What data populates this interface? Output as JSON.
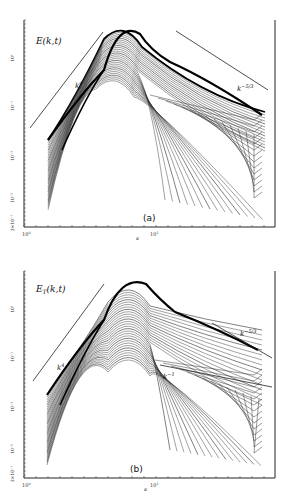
{
  "chart_data": [
    {
      "type": "line",
      "panel": "(a)",
      "title": "E(k,t)",
      "xlabel": "κ",
      "ylabel": "E(k,t)",
      "xscale": "log",
      "yscale": "log",
      "x_tick_labels": [
        "10^0",
        "10^1"
      ],
      "y_tick_labels": [
        "3×10^-7",
        "10^-5",
        "10^-3",
        "10^-1",
        "10^1"
      ],
      "annotations": [
        "k^4",
        "k^-5/3"
      ],
      "series_description": "Family of time-evolving energy spectra; peak near κ≈8, k^4 rise at low wavenumbers, k^-5/3 inertial range at high wavenumbers",
      "reference_lines": [
        {
          "name": "k^4",
          "slope": 4
        },
        {
          "name": "k^-5/3",
          "slope": -1.6667
        }
      ]
    },
    {
      "type": "line",
      "panel": "(b)",
      "title": "E_T(k,t)",
      "xlabel": "κ",
      "ylabel": "E_T(k,t)",
      "xscale": "log",
      "yscale": "log",
      "x_tick_labels": [
        "10^0",
        "10^1"
      ],
      "y_tick_labels": [
        "3×10^-7",
        "10^-5",
        "10^-3",
        "10^-1",
        "10^1"
      ],
      "annotations": [
        "k^4",
        "k^-1",
        "k^-5/3"
      ],
      "series_description": "Family of time-evolving temperature variance spectra; k^4 rise, k^-1 and k^-5/3 reference slopes",
      "reference_lines": [
        {
          "name": "k^4",
          "slope": 4
        },
        {
          "name": "k^-1",
          "slope": -1
        },
        {
          "name": "k^-5/3",
          "slope": -1.6667
        }
      ]
    }
  ],
  "labels": {
    "a": {
      "title": "E(k,t)",
      "panel": "(a)",
      "xlabel": "κ",
      "slope_low": "k",
      "slope_low_exp": "4",
      "slope_high": "k",
      "slope_high_exp": "−5/3",
      "xt0": "10",
      "xt0e": "0",
      "xt1": "10",
      "xt1e": "1",
      "yt": [
        "10¹",
        "10⁻¹",
        "10⁻³",
        "10⁻⁵",
        "3×10⁻⁷"
      ]
    },
    "b": {
      "title": "E",
      "title_sub": "T",
      "title_rest": "(k,t)",
      "panel": "(b)",
      "xlabel": "κ",
      "slope_low": "k",
      "slope_low_exp": "4",
      "slope_mid": "k",
      "slope_mid_exp": "−1",
      "slope_high": "k",
      "slope_high_exp": "−5/3",
      "xt0": "10",
      "xt0e": "0",
      "xt1": "10",
      "xt1e": "1",
      "yt": [
        "10¹",
        "10⁻¹",
        "10⁻³",
        "10⁻⁵",
        "3×10⁻⁷"
      ]
    }
  }
}
